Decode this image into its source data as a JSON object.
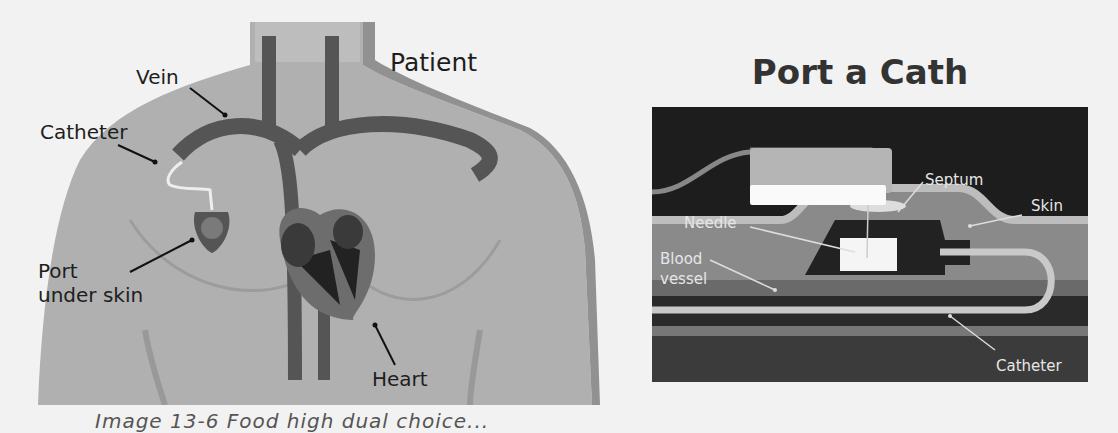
{
  "left_figure": {
    "title": "Patient",
    "labels": {
      "vein": "Vein",
      "catheter": "Catheter",
      "port": "Port",
      "port_line2": "under skin",
      "heart": "Heart"
    }
  },
  "right_figure": {
    "title": "Port a Cath",
    "labels": {
      "septum": "Septum",
      "skin": "Skin",
      "needle": "Needle",
      "blood": "Blood",
      "vessel": "vessel",
      "catheter": "Catheter"
    }
  },
  "caption": {
    "text": "Image 13-6 Food high dual choice..."
  },
  "colors": {
    "background": "#f2f2f2",
    "body": "#a9a9a9",
    "body_edge": "#8e8e8e",
    "vessel": "#555555",
    "dark_panel": "#1d1d1d",
    "label_text": "#1e1e1e",
    "white_label": "#e6e6e6"
  }
}
